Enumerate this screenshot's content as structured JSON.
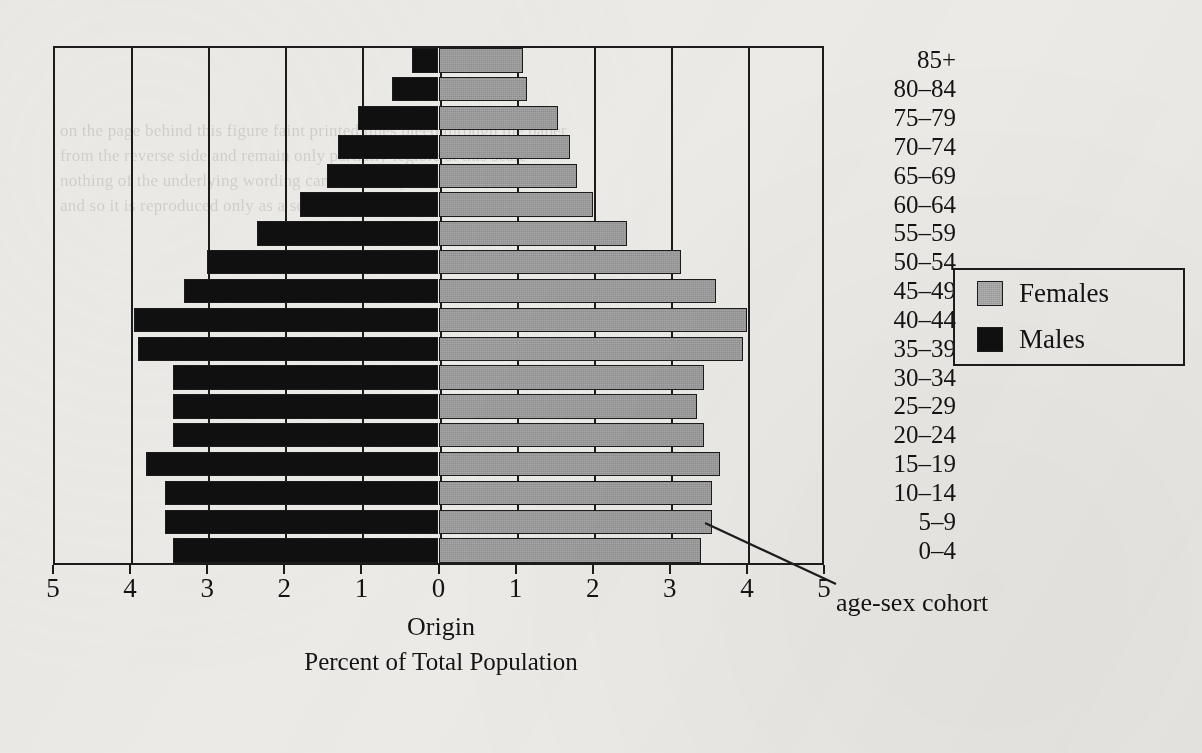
{
  "chart_data": {
    "type": "bar",
    "subtype": "population-pyramid",
    "title": "",
    "xlabel": "Percent of Total Population",
    "origin_label": "Origin",
    "ylabel": "",
    "xlim": [
      -5,
      5
    ],
    "xtick_values": [
      -5,
      -4,
      -3,
      -2,
      -1,
      0,
      1,
      2,
      3,
      4,
      5
    ],
    "xtick_labels": [
      "5",
      "4",
      "3",
      "2",
      "1",
      "0",
      "1",
      "2",
      "3",
      "4",
      "5"
    ],
    "grid": true,
    "grid_axis": "x",
    "legend_position": "right",
    "categories": [
      "85+",
      "80–84",
      "75–79",
      "70–74",
      "65–69",
      "60–64",
      "55–59",
      "50–54",
      "45–49",
      "40–44",
      "35–39",
      "30–34",
      "25–29",
      "20–24",
      "15–19",
      "10–14",
      "5–9",
      "0–4"
    ],
    "series": [
      {
        "name": "Males",
        "color": "#101010",
        "side": "left",
        "values": [
          0.35,
          0.6,
          1.05,
          1.3,
          1.45,
          1.8,
          2.35,
          3.0,
          3.3,
          3.95,
          3.9,
          3.45,
          3.45,
          3.45,
          3.8,
          3.55,
          3.55,
          3.45
        ]
      },
      {
        "name": "Females",
        "color": "#8f8f8f",
        "side": "right",
        "values": [
          1.1,
          1.15,
          1.55,
          1.7,
          1.8,
          2.0,
          2.45,
          3.15,
          3.6,
          4.0,
          3.95,
          3.45,
          3.35,
          3.45,
          3.65,
          3.55,
          3.55,
          3.4
        ]
      }
    ],
    "annotations": [
      {
        "text": "age-sex cohort",
        "points_at": "0–4 female bar tip"
      }
    ]
  },
  "legend": {
    "entries": [
      {
        "label": "Females",
        "swatch": "female-swatch"
      },
      {
        "label": "Males",
        "swatch": "male-swatch"
      }
    ]
  },
  "axis": {
    "origin_caption": "Origin",
    "x_caption": "Percent of Total Population"
  },
  "annotation": {
    "label": "age-sex cohort"
  },
  "ghost_text": "on the page behind this figure faint printed lines bleed through the paper\nfrom the reverse side and remain only partially legible at this scale\nnothing of the underlying wording can be reliably transcribed here\nand so it is reproduced only as a soft grey texture"
}
